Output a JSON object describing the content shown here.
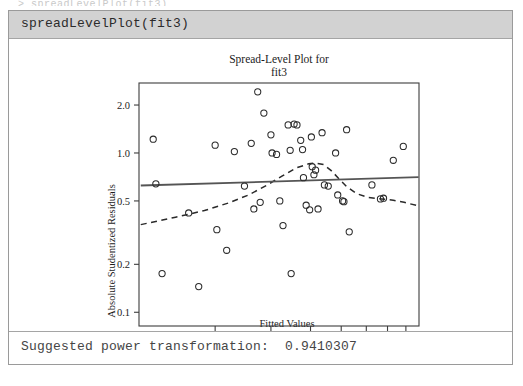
{
  "console": {
    "clipped_top_text": "> spreadLevelPlot(fit3)",
    "command": "spreadLevelPlot(fit3)",
    "output_label": "Suggested power transformation:",
    "output_value": "0.9410307"
  },
  "colors": {
    "panel_border": "#9a9a9a",
    "command_bar_bg": "#d2d2d2",
    "plot_frame": "#3d3d3d",
    "point_stroke": "#2a2a2a",
    "solid_line": "#555555",
    "dashed_line": "#2a2a2a",
    "text": "#1c1c1c"
  },
  "chart_data": {
    "type": "scatter",
    "title": "Spread-Level Plot for",
    "subtitle": "fit3",
    "xlabel": "Fitted Values",
    "ylabel": "Absolute Studentized Residuals",
    "xscale": "log",
    "yscale": "log",
    "xlim": [
      2.3,
      17.6
    ],
    "ylim": [
      0.082,
      2.75
    ],
    "xticks": [
      4,
      6,
      8,
      10,
      12,
      14,
      16
    ],
    "xticklabels": [
      "4",
      "6",
      "8",
      "10",
      "12",
      "14",
      "16"
    ],
    "yticks": [
      0.1,
      0.2,
      0.5,
      1.0,
      2.0
    ],
    "yticklabels": [
      "0.1",
      "0.2",
      "0.5",
      "1.0",
      "2.0"
    ],
    "grid": false,
    "legend": null,
    "points": [
      [
        2.55,
        1.22
      ],
      [
        2.6,
        0.64
      ],
      [
        2.72,
        0.175
      ],
      [
        3.3,
        0.42
      ],
      [
        3.55,
        0.145
      ],
      [
        4.0,
        1.12
      ],
      [
        4.05,
        0.33
      ],
      [
        4.35,
        0.245
      ],
      [
        4.6,
        1.02
      ],
      [
        4.95,
        0.62
      ],
      [
        5.2,
        1.15
      ],
      [
        5.3,
        0.445
      ],
      [
        5.45,
        2.42
      ],
      [
        5.55,
        0.49
      ],
      [
        5.7,
        1.78
      ],
      [
        6.0,
        1.3
      ],
      [
        6.05,
        1.0
      ],
      [
        6.25,
        0.98
      ],
      [
        6.4,
        0.5
      ],
      [
        6.55,
        0.35
      ],
      [
        6.8,
        1.5
      ],
      [
        6.9,
        1.04
      ],
      [
        6.95,
        0.175
      ],
      [
        7.1,
        1.52
      ],
      [
        7.25,
        1.5
      ],
      [
        7.45,
        1.2
      ],
      [
        7.55,
        1.05
      ],
      [
        7.6,
        0.7
      ],
      [
        7.75,
        0.47
      ],
      [
        7.95,
        0.44
      ],
      [
        8.05,
        1.26
      ],
      [
        8.1,
        0.82
      ],
      [
        8.2,
        0.73
      ],
      [
        8.3,
        0.78
      ],
      [
        8.45,
        0.445
      ],
      [
        8.7,
        1.34
      ],
      [
        8.85,
        0.63
      ],
      [
        9.1,
        0.62
      ],
      [
        9.6,
        1.0
      ],
      [
        9.75,
        0.545
      ],
      [
        10.1,
        0.5
      ],
      [
        10.2,
        0.495
      ],
      [
        10.4,
        1.4
      ],
      [
        10.6,
        0.32
      ],
      [
        12.5,
        0.63
      ],
      [
        13.3,
        0.515
      ],
      [
        13.6,
        0.52
      ],
      [
        14.6,
        0.9
      ],
      [
        15.7,
        1.1
      ]
    ],
    "fit_line": {
      "name": "least-squares line",
      "style": "solid",
      "points": [
        [
          2.33,
          0.625
        ],
        [
          17.55,
          0.705
        ]
      ]
    },
    "smooth_line": {
      "name": "lowess smooth",
      "style": "dashed",
      "points": [
        [
          2.33,
          0.355
        ],
        [
          3.0,
          0.395
        ],
        [
          3.7,
          0.435
        ],
        [
          4.4,
          0.485
        ],
        [
          5.1,
          0.545
        ],
        [
          5.8,
          0.625
        ],
        [
          6.5,
          0.715
        ],
        [
          7.2,
          0.805
        ],
        [
          7.9,
          0.855
        ],
        [
          8.3,
          0.865
        ],
        [
          8.8,
          0.845
        ],
        [
          9.3,
          0.775
        ],
        [
          9.8,
          0.695
        ],
        [
          10.4,
          0.615
        ],
        [
          11.2,
          0.555
        ],
        [
          12.2,
          0.525
        ],
        [
          13.4,
          0.515
        ],
        [
          14.6,
          0.505
        ],
        [
          15.8,
          0.49
        ],
        [
          17.55,
          0.465
        ]
      ]
    }
  }
}
